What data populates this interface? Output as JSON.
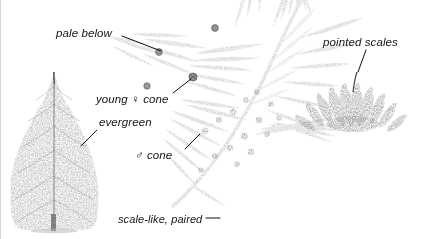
{
  "figure": {
    "background_color": "#ffffff",
    "ink_color": "#141414",
    "foliage_tone": "#8e8e8e",
    "cone_tone": "#2b2b2b",
    "tree_tone": "#6e6e6e"
  },
  "labels": [
    {
      "id": "pale-below",
      "text": "pale below",
      "x": 55,
      "y": 27,
      "leader": {
        "x1": 121,
        "y1": 36,
        "x2": 160,
        "y2": 51
      }
    },
    {
      "id": "young-female-cone",
      "text": "young ♀ cone",
      "x": 95,
      "y": 93,
      "leader": {
        "x1": 172,
        "y1": 93,
        "x2": 190,
        "y2": 79
      }
    },
    {
      "id": "evergreen",
      "text": "evergreen",
      "x": 98,
      "y": 116,
      "leader": {
        "x1": 96,
        "y1": 130,
        "x2": 80,
        "y2": 146
      }
    },
    {
      "id": "male-cone",
      "text": "♂ cone",
      "x": 134,
      "y": 149,
      "leader": {
        "x1": 184,
        "y1": 149,
        "x2": 199,
        "y2": 134
      }
    },
    {
      "id": "scale-like-paired",
      "text": "scale-like, paired",
      "x": 117,
      "y": 213,
      "leader": {
        "x1": 205,
        "y1": 218,
        "x2": 219,
        "y2": 218
      }
    },
    {
      "id": "pointed-scales",
      "text": "pointed scales",
      "x": 322,
      "y": 36,
      "leader": {
        "x1": 365,
        "y1": 50,
        "x2": 357,
        "y2": 72
      }
    }
  ],
  "specimens": [
    {
      "id": "whole-tree",
      "kind": "conifer-tree-habit",
      "x": 10,
      "y": 72,
      "w": 88,
      "h": 158
    },
    {
      "id": "foliage-spray",
      "kind": "scale-leaf-spray-with-cones",
      "x": 118,
      "y": 0,
      "w": 200,
      "h": 210
    },
    {
      "id": "mature-cone",
      "kind": "open-cone-pointed-scales",
      "x": 300,
      "y": 62,
      "w": 110,
      "h": 90
    }
  ]
}
